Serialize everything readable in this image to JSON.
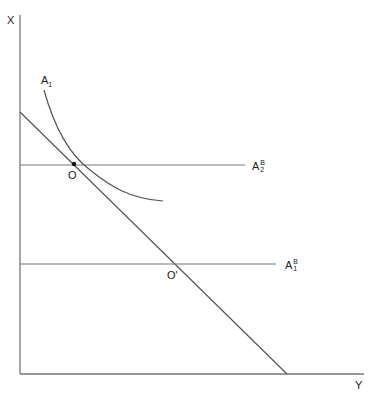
{
  "diagram": {
    "axes": {
      "y_axis_label": "X",
      "x_axis_label": "Y"
    },
    "curve": {
      "label_base": "A",
      "label_sub": "1"
    },
    "lines": {
      "upper_horizontal": {
        "base": "A",
        "sup": "B",
        "sub": "2"
      },
      "lower_horizontal": {
        "base": "A",
        "sup": "B",
        "sub": "1"
      }
    },
    "points": {
      "tangency": "O",
      "intersection": "O'"
    },
    "colors": {
      "line": "#555555",
      "point": "#111111",
      "text": "#222222"
    }
  }
}
